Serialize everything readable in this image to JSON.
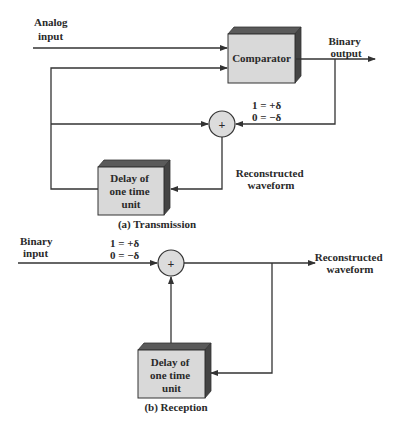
{
  "transmission": {
    "caption": "(a) Transmission",
    "analog_input_label": [
      "Analog",
      "input"
    ],
    "comparator_label": "Comparator",
    "binary_output_label": [
      "Binary",
      "output"
    ],
    "mapping": [
      "1 = +δ",
      "0 = −δ"
    ],
    "sum_symbol": "+",
    "reconstructed_label": [
      "Reconstructed",
      "waveform"
    ],
    "delay_label": [
      "Delay of",
      "one time",
      "unit"
    ]
  },
  "reception": {
    "caption": "(b) Reception",
    "binary_input_label": [
      "Binary",
      "input"
    ],
    "mapping": [
      "1 = +δ",
      "0 = −δ"
    ],
    "sum_symbol": "+",
    "reconstructed_label": [
      "Reconstructed",
      "waveform"
    ],
    "delay_label": [
      "Delay of",
      "one time",
      "unit"
    ]
  },
  "colors": {
    "box_front": "#d9d9d9",
    "box_top": "#5a5a5a",
    "box_side": "#444444",
    "circle_fill": "#dcdcdc",
    "line": "#333333"
  }
}
